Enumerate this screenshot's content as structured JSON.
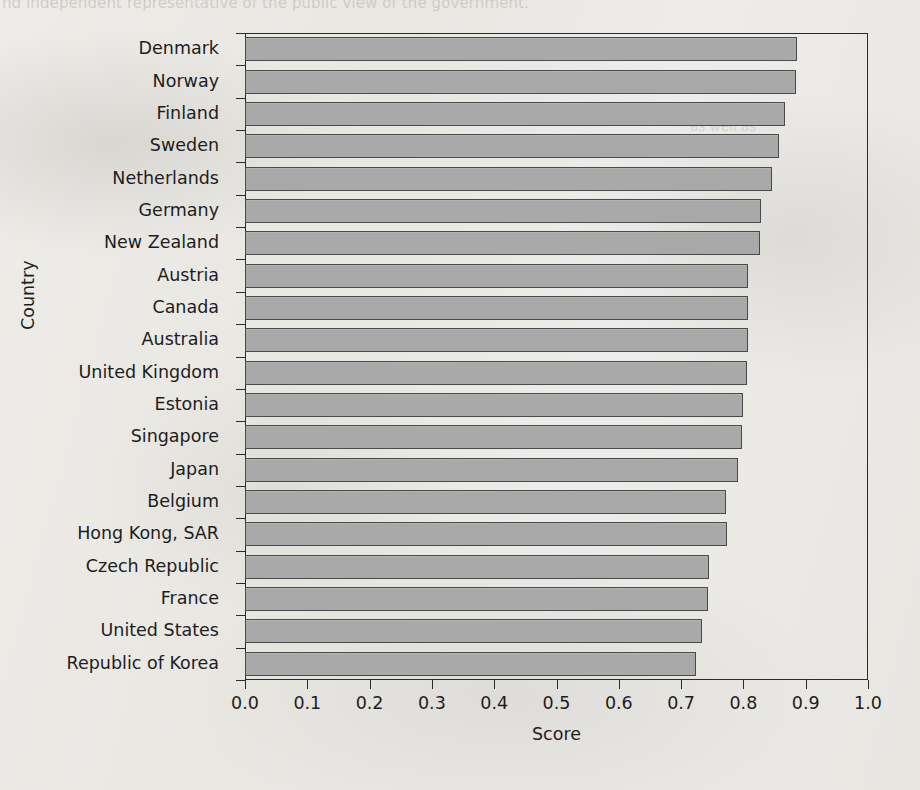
{
  "page": {
    "bleed_text_top": "nd independent representative of the public view of the government.",
    "bleed_text_right_1": "government,",
    "bleed_text_right_2": "as well as"
  },
  "chart_data": {
    "type": "bar",
    "orientation": "horizontal",
    "title": "",
    "xlabel": "Score",
    "ylabel": "Country",
    "xlim": [
      0.0,
      1.0
    ],
    "xticks": [
      "0.0",
      "0.1",
      "0.2",
      "0.3",
      "0.4",
      "0.5",
      "0.6",
      "0.7",
      "0.8",
      "0.9",
      "1.0"
    ],
    "xtick_values": [
      0.0,
      0.1,
      0.2,
      0.3,
      0.4,
      0.5,
      0.6,
      0.7,
      0.8,
      0.9,
      1.0
    ],
    "grid": false,
    "legend": "none",
    "bar_color": "#a9a9a9",
    "bar_edge_color": "#4a4a4a",
    "categories": [
      "Denmark",
      "Norway",
      "Finland",
      "Sweden",
      "Netherlands",
      "Germany",
      "New Zealand",
      "Austria",
      "Canada",
      "Australia",
      "United Kingdom",
      "Estonia",
      "Singapore",
      "Japan",
      "Belgium",
      "Hong Kong, SAR",
      "Czech Republic",
      "France",
      "United States",
      "Republic of Korea"
    ],
    "values": [
      0.886,
      0.884,
      0.866,
      0.857,
      0.846,
      0.828,
      0.826,
      0.808,
      0.807,
      0.807,
      0.806,
      0.799,
      0.798,
      0.792,
      0.772,
      0.773,
      0.744,
      0.743,
      0.733,
      0.724
    ]
  }
}
